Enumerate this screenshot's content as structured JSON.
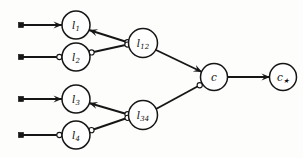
{
  "figure": {
    "kind": "tree-diagram",
    "background_color": "#fdfdfc",
    "line_color": "#161616",
    "node_fill": "#ffffff",
    "node_stroke": "#161616"
  },
  "nodes": [
    {
      "id": "l1",
      "label_base": "l",
      "label_sub": "1",
      "cx": 76,
      "cy": 25,
      "r": 14
    },
    {
      "id": "l2",
      "label_base": "l",
      "label_sub": "2",
      "cx": 76,
      "cy": 57,
      "r": 14
    },
    {
      "id": "l12",
      "label_base": "l",
      "label_sub": "12",
      "cx": 143,
      "cy": 43,
      "r": 14.5
    },
    {
      "id": "l3",
      "label_base": "l",
      "label_sub": "3",
      "cx": 76,
      "cy": 99,
      "r": 14
    },
    {
      "id": "l4",
      "label_base": "l",
      "label_sub": "4",
      "cx": 76,
      "cy": 135,
      "r": 14
    },
    {
      "id": "l34",
      "label_base": "l",
      "label_sub": "34",
      "cx": 143,
      "cy": 115,
      "r": 14.5
    },
    {
      "id": "c",
      "label_base": "c",
      "label_sub": "",
      "cx": 214,
      "cy": 77,
      "r": 13.5
    },
    {
      "id": "cstar",
      "label_base": "c",
      "label_sub": "★",
      "cx": 283,
      "cy": 77,
      "r": 13.5
    }
  ],
  "terminals": [
    {
      "id": "t1",
      "x": 21,
      "y": 25
    },
    {
      "id": "t2",
      "x": 21,
      "y": 57
    },
    {
      "id": "t3",
      "x": 21,
      "y": 99
    },
    {
      "id": "t4",
      "x": 21,
      "y": 135
    }
  ],
  "edges": [
    {
      "id": "t1-l1",
      "from": "t1",
      "to": "l1",
      "x1": 21,
      "y1": 25,
      "x2": 62,
      "y2": 25,
      "end_marker": "arrow",
      "start_marker": "square"
    },
    {
      "id": "t2-l2",
      "from": "t2",
      "to": "l2",
      "x1": 21,
      "y1": 57,
      "x2": 62,
      "y2": 57,
      "end_marker": "bubble",
      "start_marker": "square"
    },
    {
      "id": "t3-l3",
      "from": "t3",
      "to": "l3",
      "x1": 21,
      "y1": 99,
      "x2": 62,
      "y2": 99,
      "end_marker": "arrow",
      "start_marker": "square"
    },
    {
      "id": "t4-l4",
      "from": "t4",
      "to": "l4",
      "x1": 21,
      "y1": 135,
      "x2": 62,
      "y2": 135,
      "end_marker": "bubble",
      "start_marker": "square"
    },
    {
      "id": "l1-l12",
      "from": "l1",
      "to": "l12",
      "x1": 89,
      "y1": 30,
      "x2": 130,
      "y2": 43,
      "end_marker": "bubble",
      "start_marker": "arrow"
    },
    {
      "id": "l2-l12",
      "from": "l2",
      "to": "l12",
      "x1": 89,
      "y1": 53,
      "x2": 130,
      "y2": 44,
      "end_marker": "bubble",
      "start_marker": "bubble"
    },
    {
      "id": "l3-l34",
      "from": "l3",
      "to": "l34",
      "x1": 89,
      "y1": 103,
      "x2": 130,
      "y2": 115,
      "end_marker": "bubble",
      "start_marker": "arrow"
    },
    {
      "id": "l4-l34",
      "from": "l4",
      "to": "l34",
      "x1": 89,
      "y1": 131,
      "x2": 130,
      "y2": 117,
      "end_marker": "bubble",
      "start_marker": "bubble"
    },
    {
      "id": "l12-c",
      "from": "l12",
      "to": "c",
      "x1": 156,
      "y1": 50,
      "x2": 202,
      "y2": 72,
      "end_marker": "arrow",
      "start_marker": "none"
    },
    {
      "id": "l34-c",
      "from": "l34",
      "to": "c",
      "x1": 156,
      "y1": 109,
      "x2": 202,
      "y2": 84,
      "end_marker": "bubble",
      "start_marker": "none"
    },
    {
      "id": "c-cstar",
      "from": "c",
      "to": "cstar",
      "x1": 228,
      "y1": 77,
      "x2": 270,
      "y2": 77,
      "end_marker": "arrow",
      "start_marker": "none"
    }
  ]
}
